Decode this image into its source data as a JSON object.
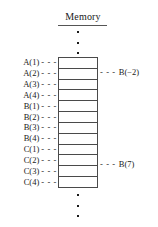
{
  "figure": {
    "title": "Memory",
    "title_underlined": true,
    "dash_glyph": "- - -",
    "ellipsis_dot_count": 3,
    "colors": {
      "ink": "#1a1a1a",
      "rule": "#4a4a4a",
      "background": "#ffffff"
    },
    "cell_count": 12,
    "left_labels": [
      {
        "text": "A(1)",
        "dash": "- - -"
      },
      {
        "text": "A(2)",
        "dash": "- - -"
      },
      {
        "text": "A(3)",
        "dash": "- - -"
      },
      {
        "text": "A(4)",
        "dash": "- - -"
      },
      {
        "text": "B(1)",
        "dash": "- - -"
      },
      {
        "text": "B(2)",
        "dash": "- - -"
      },
      {
        "text": "B(3)",
        "dash": "- - -"
      },
      {
        "text": "B(4)",
        "dash": "- - -"
      },
      {
        "text": "C(1)",
        "dash": "- - -"
      },
      {
        "text": "C(2)",
        "dash": "- - -"
      },
      {
        "text": "C(3)",
        "dash": "- - -"
      },
      {
        "text": "C(4)",
        "dash": "- - -"
      }
    ],
    "right_callouts": [
      {
        "dash": "- - -",
        "text": "B(−2)",
        "aligns_with": "A(2)"
      },
      {
        "dash": "- - -",
        "text": "B(7)",
        "aligns_with": "C(3)"
      }
    ]
  }
}
